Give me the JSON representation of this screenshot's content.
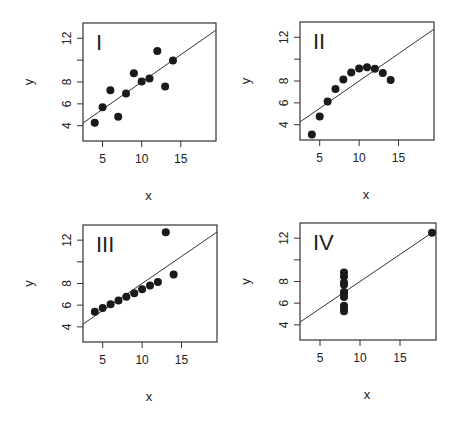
{
  "chart_data": [
    {
      "type": "scatter",
      "title": "I",
      "xlabel": "x",
      "ylabel": "y",
      "x_ticks": [
        5,
        10,
        15
      ],
      "y_ticks": [
        4,
        6,
        8,
        10,
        12
      ],
      "y_tick_labels": [
        "4",
        "6",
        "8",
        "",
        "12"
      ],
      "xlim": [
        2.5,
        19.5
      ],
      "ylim": [
        2.6,
        13.4
      ],
      "grid": false,
      "fit_line": {
        "intercept": 3.0,
        "slope": 0.5
      },
      "x": [
        10,
        8,
        13,
        9,
        11,
        14,
        6,
        4,
        12,
        7,
        5
      ],
      "y": [
        8.04,
        6.95,
        7.58,
        8.81,
        8.33,
        9.96,
        7.24,
        4.26,
        10.84,
        4.82,
        5.68
      ]
    },
    {
      "type": "scatter",
      "title": "II",
      "xlabel": "x",
      "ylabel": "y",
      "x_ticks": [
        5,
        10,
        15
      ],
      "y_ticks": [
        4,
        6,
        8,
        10,
        12
      ],
      "y_tick_labels": [
        "4",
        "6",
        "8",
        "",
        "12"
      ],
      "xlim": [
        2.5,
        19.5
      ],
      "ylim": [
        2.6,
        13.4
      ],
      "grid": false,
      "fit_line": {
        "intercept": 3.0,
        "slope": 0.5
      },
      "x": [
        10,
        8,
        13,
        9,
        11,
        14,
        6,
        4,
        12,
        7,
        5
      ],
      "y": [
        9.14,
        8.14,
        8.74,
        8.77,
        9.26,
        8.1,
        6.13,
        3.1,
        9.13,
        7.26,
        4.74
      ]
    },
    {
      "type": "scatter",
      "title": "III",
      "xlabel": "x",
      "ylabel": "y",
      "x_ticks": [
        5,
        10,
        15
      ],
      "y_ticks": [
        4,
        6,
        8,
        10,
        12
      ],
      "y_tick_labels": [
        "4",
        "6",
        "8",
        "",
        "12"
      ],
      "xlim": [
        2.5,
        19.5
      ],
      "ylim": [
        2.6,
        13.4
      ],
      "grid": false,
      "fit_line": {
        "intercept": 3.0,
        "slope": 0.5
      },
      "x": [
        10,
        8,
        13,
        9,
        11,
        14,
        6,
        4,
        12,
        7,
        5
      ],
      "y": [
        7.46,
        6.77,
        12.74,
        7.11,
        7.81,
        8.84,
        6.08,
        5.39,
        8.15,
        6.42,
        5.73
      ]
    },
    {
      "type": "scatter",
      "title": "IV",
      "xlabel": "x",
      "ylabel": "y",
      "x_ticks": [
        5,
        10,
        15
      ],
      "y_ticks": [
        4,
        6,
        8,
        10,
        12
      ],
      "y_tick_labels": [
        "4",
        "6",
        "8",
        "",
        "12"
      ],
      "xlim": [
        2.5,
        19.5
      ],
      "ylim": [
        2.6,
        13.4
      ],
      "grid": false,
      "fit_line": {
        "intercept": 3.0,
        "slope": 0.5
      },
      "x": [
        8,
        8,
        8,
        8,
        8,
        8,
        8,
        19,
        8,
        8,
        8
      ],
      "y": [
        6.58,
        5.76,
        7.71,
        8.84,
        8.47,
        7.04,
        5.25,
        12.5,
        5.56,
        7.91,
        6.89
      ]
    }
  ],
  "layout": {
    "panels": [
      {
        "left": 83,
        "top": 23,
        "width": 133,
        "height": 118
      },
      {
        "left": 300,
        "top": 22,
        "width": 134,
        "height": 118
      },
      {
        "left": 83,
        "top": 225,
        "width": 134,
        "height": 117
      },
      {
        "left": 300,
        "top": 223,
        "width": 136,
        "height": 117
      }
    ]
  }
}
